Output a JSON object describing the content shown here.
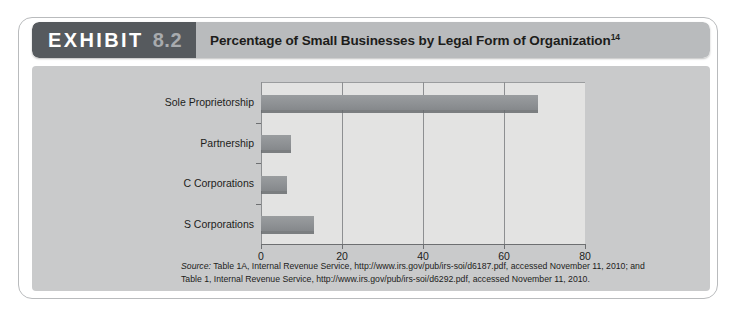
{
  "header": {
    "exhibit_word": "EXHIBIT",
    "exhibit_number": "8.2",
    "title": "Percentage of Small Businesses by Legal Form of Organization",
    "title_superscript": "14",
    "tag_bg": "#565a5e",
    "title_bg": "#b9bbbd"
  },
  "panel": {
    "bg": "#c9cacb",
    "plot_bg": "#e3e3e2"
  },
  "chart_data": {
    "type": "bar",
    "orientation": "horizontal",
    "title": "Percentage of Small Businesses by Legal Form of Organization",
    "categories": [
      "Sole Proprietorship",
      "Partnership",
      "C Corporations",
      "S Corporations"
    ],
    "values": [
      68.4,
      7.4,
      6.5,
      13.1
    ],
    "xlabel": "",
    "ylabel": "",
    "xlim": [
      0,
      80
    ],
    "ticks": [
      "0",
      "20",
      "40",
      "60",
      "80"
    ],
    "tick_values": [
      0,
      20,
      40,
      60,
      80
    ],
    "grid": true,
    "legend": false,
    "bar_color": "#8f9295",
    "bar_shadow_color": "#696c6f"
  },
  "source": {
    "label": "Source:",
    "line1": " Table 1A, Internal Revenue Service, http://www.irs.gov/pub/irs-soi/d6187.pdf, accessed November 11, 2010; and",
    "line2": "Table 1, Internal Revenue Service, http://www.irs.gov/pub/irs-soi/d6292.pdf, accessed November 11, 2010."
  }
}
